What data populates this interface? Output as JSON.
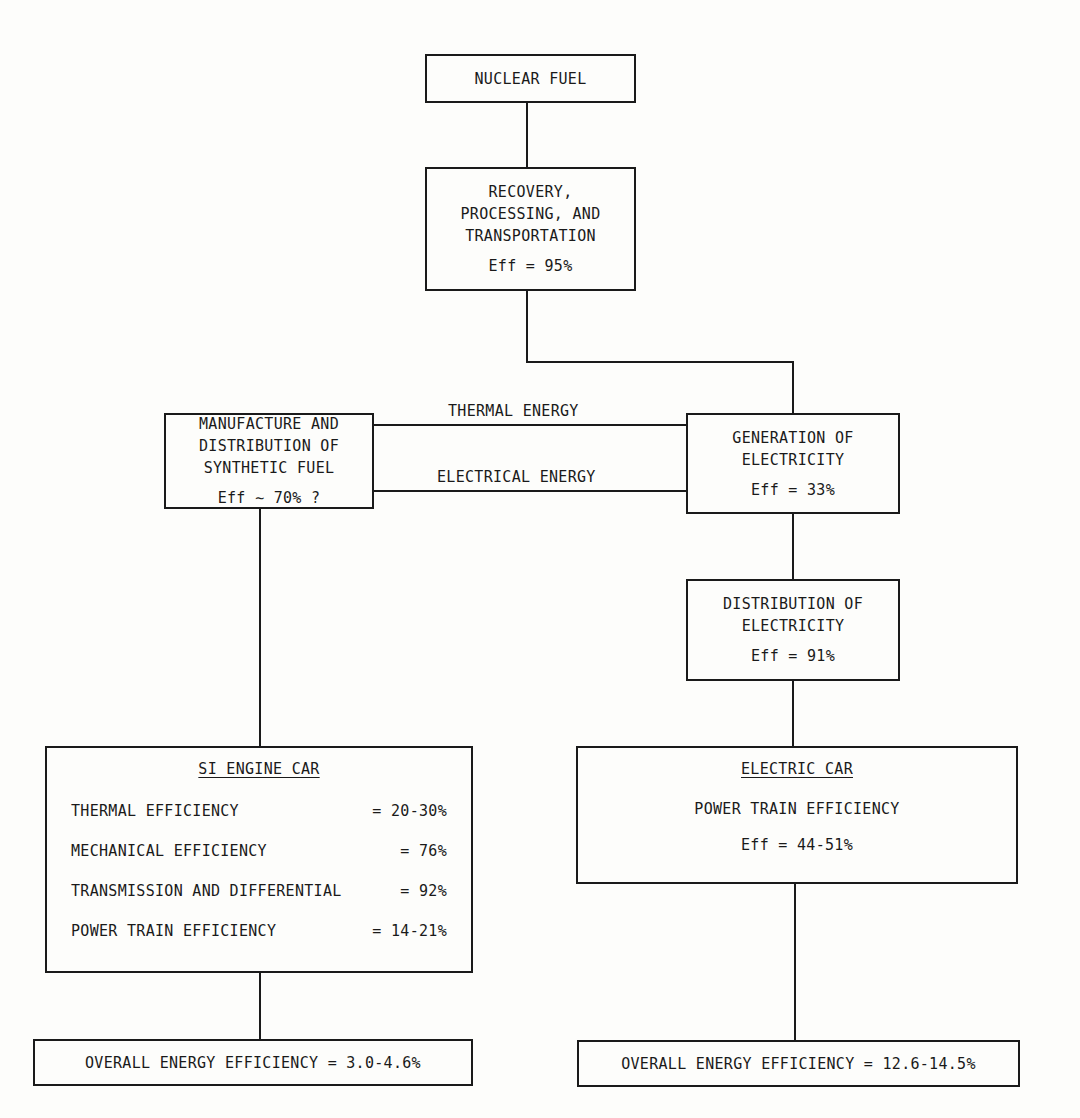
{
  "nodes": {
    "nuclear_fuel": {
      "label": "NUCLEAR FUEL"
    },
    "recovery": {
      "lines": [
        "RECOVERY,",
        "PROCESSING, AND",
        "TRANSPORTATION"
      ],
      "eff": "Eff = 95%"
    },
    "synthetic_fuel": {
      "lines": [
        "MANUFACTURE AND",
        "DISTRIBUTION OF",
        "SYNTHETIC FUEL"
      ],
      "eff": "Eff ∼ 70% ?"
    },
    "generation": {
      "lines": [
        "GENERATION OF",
        "ELECTRICITY"
      ],
      "eff": "Eff = 33%"
    },
    "distribution": {
      "lines": [
        "DISTRIBUTION OF",
        "ELECTRICITY"
      ],
      "eff": "Eff = 91%"
    },
    "si_engine_car": {
      "title": "SI ENGINE CAR",
      "rows": [
        {
          "label": "THERMAL EFFICIENCY",
          "value": "= 20-30%"
        },
        {
          "label": "MECHANICAL EFFICIENCY",
          "value": "= 76%"
        },
        {
          "label": "TRANSMISSION AND DIFFERENTIAL",
          "value": "= 92%"
        },
        {
          "label": "POWER TRAIN EFFICIENCY",
          "value": "= 14-21%"
        }
      ]
    },
    "electric_car": {
      "title": "ELECTRIC CAR",
      "subtitle": "POWER TRAIN EFFICIENCY",
      "eff": "Eff = 44-51%"
    },
    "overall_si": {
      "label": "OVERALL ENERGY EFFICIENCY = 3.0-4.6%"
    },
    "overall_electric": {
      "label": "OVERALL ENERGY EFFICIENCY = 12.6-14.5%"
    }
  },
  "edges": {
    "thermal_energy": "THERMAL ENERGY",
    "electrical_energy": "ELECTRICAL ENERGY"
  }
}
